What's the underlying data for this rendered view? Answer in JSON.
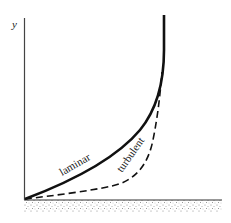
{
  "diagram": {
    "type": "boundary-layer-velocity-profile",
    "axis_label_y": "y",
    "curves": [
      {
        "name": "laminar",
        "label": "laminar",
        "style": "solid"
      },
      {
        "name": "turbulent",
        "label": "turbulent",
        "style": "dashed"
      }
    ],
    "wall": {
      "style": "stippled"
    },
    "colors": {
      "ink": "#111111",
      "background": "#ffffff",
      "stipple": "#9a9a9a"
    }
  }
}
